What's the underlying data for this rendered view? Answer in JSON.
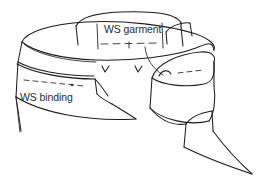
{
  "figure": {
    "kind": "sewing-instruction-line-drawing",
    "background_color": "#ffffff",
    "ink_color": "#1c1c1c",
    "stitch_color": "#3a3a3a",
    "labels": [
      {
        "id": "garment",
        "text": "WS garment",
        "x": 104,
        "y": 33
      },
      {
        "id": "binding",
        "text": "WS binding",
        "x": 20,
        "y": 101
      }
    ],
    "annotations": {
      "notch_marks": 2,
      "leader_lines": 1,
      "stitch_dash_rows": 3,
      "pin_dots": 1
    }
  }
}
